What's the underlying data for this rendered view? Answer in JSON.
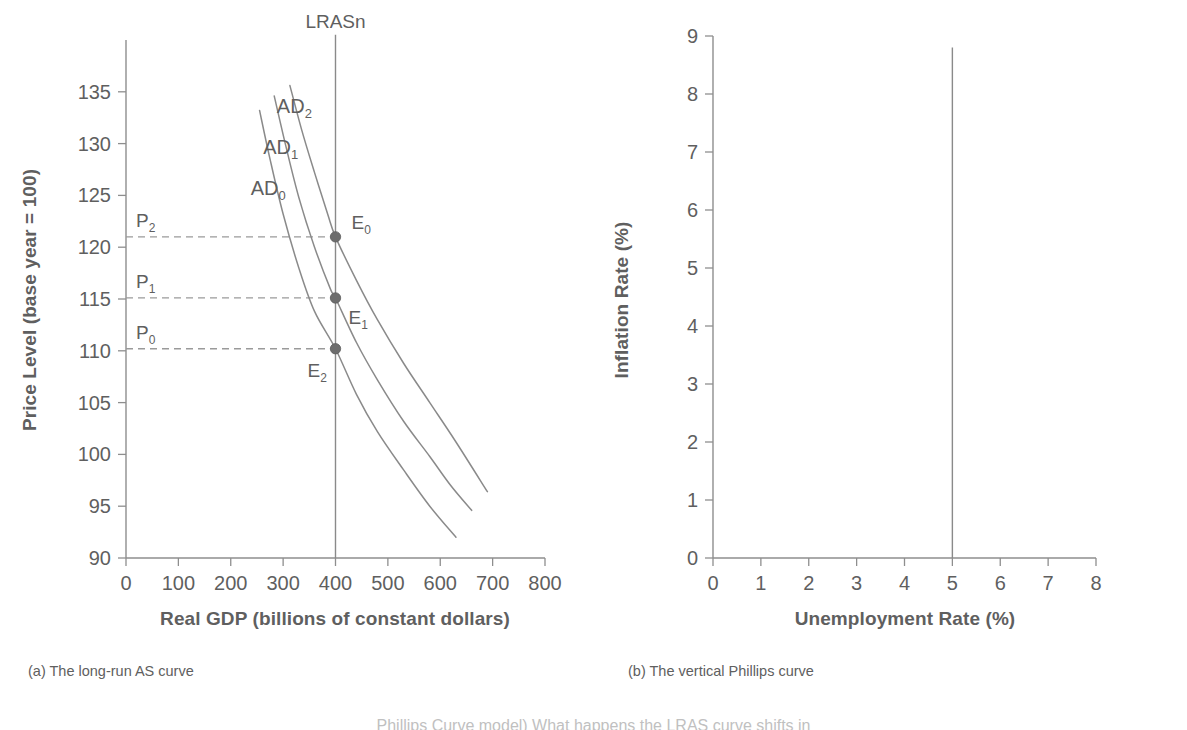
{
  "figure": {
    "panels": [
      {
        "id": "panel-a",
        "caption": "(a) The long-run AS curve"
      },
      {
        "id": "panel-b",
        "caption": "(b) The vertical Phillips curve"
      }
    ],
    "bottom_text": "Phillips Curve model) What happens the LRAS curve shifts in"
  },
  "chart_data": [
    {
      "type": "line",
      "panel": "a",
      "title": "(a) The long-run AS curve",
      "xlabel": "Real GDP (billions of constant dollars)",
      "ylabel": "Price Level (base year = 100)",
      "xlim": [
        0,
        800
      ],
      "ylim": [
        90,
        140
      ],
      "xticks": [
        "0",
        "100",
        "200",
        "300",
        "400",
        "500",
        "600",
        "700",
        "800"
      ],
      "xtick_values": [
        0,
        100,
        200,
        300,
        400,
        500,
        600,
        700,
        800
      ],
      "yticks": [
        "90",
        "95",
        "100",
        "105",
        "110",
        "115",
        "120",
        "125",
        "130",
        "135"
      ],
      "ytick_values": [
        90,
        95,
        100,
        105,
        110,
        115,
        120,
        125,
        130,
        135
      ],
      "grid": false,
      "legend": "none",
      "series": [
        {
          "name": "AD_0",
          "label_base": "AD",
          "label_sub": "0",
          "label_x": 238,
          "label_y": 125,
          "points": [
            [
              255,
              133.2
            ],
            [
              275,
              128.5
            ],
            [
              300,
              123.2
            ],
            [
              330,
              118.0
            ],
            [
              360,
              113.8
            ],
            [
              400,
              110.2
            ],
            [
              440,
              105.8
            ],
            [
              480,
              102.2
            ],
            [
              530,
              98.5
            ],
            [
              580,
              95.0
            ],
            [
              630,
              92.0
            ]
          ]
        },
        {
          "name": "AD_1",
          "label_base": "AD",
          "label_sub": "1",
          "label_x": 262,
          "label_y": 129,
          "points": [
            [
              283,
              134.6
            ],
            [
              305,
              129.8
            ],
            [
              330,
              124.8
            ],
            [
              360,
              120.0
            ],
            [
              390,
              116.0
            ],
            [
              400,
              115.1
            ],
            [
              440,
              110.8
            ],
            [
              480,
              107.2
            ],
            [
              530,
              103.2
            ],
            [
              580,
              99.8
            ],
            [
              620,
              97.0
            ],
            [
              660,
              94.6
            ]
          ]
        },
        {
          "name": "AD_2",
          "label_base": "AD",
          "label_sub": "2",
          "label_x": 288,
          "label_y": 133,
          "points": [
            [
              313,
              135.6
            ],
            [
              335,
              131.4
            ],
            [
              360,
              127.2
            ],
            [
              385,
              123.2
            ],
            [
              400,
              121.0
            ],
            [
              440,
              116.8
            ],
            [
              480,
              113.0
            ],
            [
              530,
              108.8
            ],
            [
              580,
              105.0
            ],
            [
              630,
              101.2
            ],
            [
              690,
              96.4
            ]
          ]
        }
      ],
      "vertical_lines": [
        {
          "name": "LRASn",
          "label": "LRASn",
          "x_value": 400,
          "y_from": 90,
          "y_to": 140.5
        }
      ],
      "equilibria": [
        {
          "name": "E_0",
          "label_base": "E",
          "label_sub": "0",
          "x": 400,
          "y": 121.0,
          "label_dx": 16,
          "label_dy": -8
        },
        {
          "name": "E_1",
          "label_base": "E",
          "label_sub": "1",
          "x": 400,
          "y": 115.1,
          "label_dx": 13,
          "label_dy": 26
        },
        {
          "name": "E_2",
          "label_base": "E",
          "label_sub": "2",
          "x": 400,
          "y": 110.2,
          "label_dx": -28,
          "label_dy": 28
        }
      ],
      "price_guides": [
        {
          "name": "P_2",
          "label_base": "P",
          "label_sub": "2",
          "y": 121.0,
          "x_from": 0,
          "x_to": 400
        },
        {
          "name": "P_1",
          "label_base": "P",
          "label_sub": "1",
          "y": 115.1,
          "x_from": 0,
          "x_to": 400
        },
        {
          "name": "P_0",
          "label_base": "P",
          "label_sub": "0",
          "y": 110.2,
          "x_from": 0,
          "x_to": 400
        }
      ]
    },
    {
      "type": "line",
      "panel": "b",
      "title": "(b) The vertical Phillips curve",
      "xlabel": "Unemployment Rate (%)",
      "ylabel": "Inflation Rate (%)",
      "xlim": [
        0,
        8
      ],
      "ylim": [
        0,
        9
      ],
      "xticks": [
        "0",
        "1",
        "2",
        "3",
        "4",
        "5",
        "6",
        "7",
        "8"
      ],
      "xtick_values": [
        0,
        1,
        2,
        3,
        4,
        5,
        6,
        7,
        8
      ],
      "yticks": [
        "0",
        "1",
        "2",
        "3",
        "4",
        "5",
        "6",
        "7",
        "8",
        "9"
      ],
      "ytick_values": [
        0,
        1,
        2,
        3,
        4,
        5,
        6,
        7,
        8,
        9
      ],
      "grid": false,
      "legend": "none",
      "series": [],
      "vertical_lines": [
        {
          "name": "long-run-phillips-curve",
          "label": "",
          "x_value": 5,
          "y_from": 0,
          "y_to": 8.8
        }
      ]
    }
  ],
  "colors": {
    "line": "#8a8a8a",
    "axis": "#8e8e8e",
    "text": "#5f5f5f",
    "dot": "#6d6d6d",
    "background": "#ffffff"
  }
}
